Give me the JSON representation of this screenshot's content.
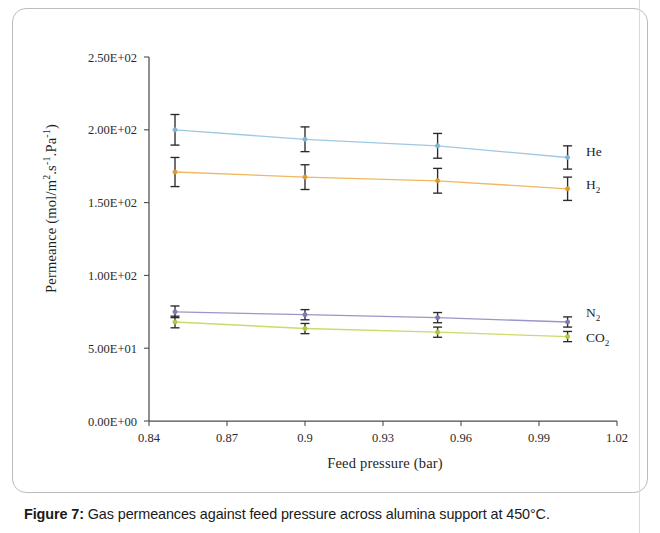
{
  "figure": {
    "caption_label": "Figure 7:",
    "caption_text": " Gas permeances against feed pressure across alumina support at 450°C."
  },
  "chart_data": {
    "type": "line",
    "title": "",
    "xlabel": "Feed pressure (bar)",
    "ylabel": "Permeance (mol/m².s⁻¹.Pa⁻¹)",
    "xlim": [
      0.84,
      1.02
    ],
    "ylim": [
      0,
      250
    ],
    "xticks": [
      0.84,
      0.87,
      0.9,
      0.93,
      0.96,
      0.99,
      1.02
    ],
    "xtick_labels": [
      "0.84",
      "0.87",
      "0.9",
      "0.93",
      "0.96",
      "0.99",
      "1.02"
    ],
    "yticks": [
      0,
      50,
      100,
      150,
      200,
      250
    ],
    "ytick_labels": [
      "0.00E+00",
      "5.00E+01",
      "1.00E+02",
      "1.50E+02",
      "2.00E+02",
      "2.50E+02"
    ],
    "grid": false,
    "legend_position": "right-inline",
    "x": [
      0.85,
      0.9,
      0.951,
      1.001
    ],
    "series": [
      {
        "name": "He",
        "label": "He",
        "color": "#9fc8e3",
        "marker_color": "#7fb5d8",
        "values": [
          200,
          193.5,
          189,
          181
        ],
        "errors": [
          10.5,
          8.5,
          8.5,
          8.0
        ]
      },
      {
        "name": "H2",
        "label": "H₂",
        "color": "#f0b860",
        "marker_color": "#e09a33",
        "values": [
          171,
          167.5,
          165,
          159.5
        ],
        "errors": [
          10.0,
          8.5,
          8.5,
          8.0
        ]
      },
      {
        "name": "N2",
        "label": "N₂",
        "color": "#9a96c8",
        "marker_color": "#7e79b6",
        "values": [
          75,
          73,
          71,
          68
        ],
        "errors": [
          4.0,
          3.5,
          3.5,
          3.5
        ]
      },
      {
        "name": "CO2",
        "label": "CO₂",
        "color": "#cdd96a",
        "marker_color": "#b6c444",
        "values": [
          68,
          63.5,
          61,
          58
        ],
        "errors": [
          4.0,
          3.5,
          3.5,
          3.5
        ]
      }
    ]
  },
  "series_labels": [
    {
      "label": "He",
      "top": 144
    },
    {
      "label": "H₂",
      "top": 177
    },
    {
      "label": "N₂",
      "top": 305
    },
    {
      "label": "CO₂",
      "top": 330
    }
  ]
}
